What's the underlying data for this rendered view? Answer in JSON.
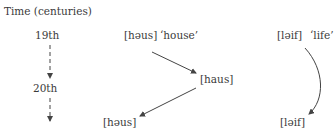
{
  "axis": {
    "title": "Time (centuries)",
    "centuries": [
      "19th",
      "20th"
    ]
  },
  "house": {
    "stage1": "[həus]",
    "gloss": "‘house’",
    "stage2": "[haus]",
    "stage3": "[həus]"
  },
  "life": {
    "stage1": "[ləif]",
    "gloss": "‘life’",
    "stage2": "[ləif]"
  },
  "colors": {
    "text": "#3a3a3a",
    "line": "#444444"
  }
}
